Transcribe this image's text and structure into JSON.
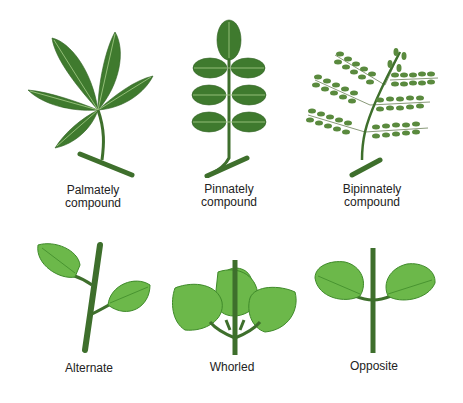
{
  "colors": {
    "dark_leaf": "#3f7a2e",
    "dark_leaf_light": "#5f9a48",
    "light_leaf": "#6cb84a",
    "light_leaf_dark": "#3f8a2a",
    "stem": "#3e6f2c",
    "vein": "#a8cf8a",
    "text": "#222222"
  },
  "panels": [
    {
      "id": "palmately",
      "label_line1": "Palmately",
      "label_line2": "compound"
    },
    {
      "id": "pinnately",
      "label_line1": "Pinnately",
      "label_line2": "compound"
    },
    {
      "id": "bipinnately",
      "label_line1": "Bipinnately",
      "label_line2": "compound"
    },
    {
      "id": "alternate",
      "label_line1": "Alternate",
      "label_line2": ""
    },
    {
      "id": "whorled",
      "label_line1": "Whorled",
      "label_line2": ""
    },
    {
      "id": "opposite",
      "label_line1": "Opposite",
      "label_line2": ""
    }
  ]
}
